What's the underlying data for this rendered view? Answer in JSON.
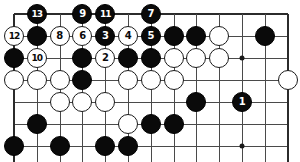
{
  "diagram": {
    "type": "go-board-problem-diagram",
    "board": {
      "columns": 13,
      "rows": 7,
      "origin_x": 14,
      "origin_y": 14,
      "step_x": 22.8,
      "step_y": 22.0,
      "line_color": "#4a4a4a",
      "edge_color": "#2b2b2b",
      "background_color": "#ffffff"
    },
    "star_points": [
      {
        "col": 2,
        "row": 6
      },
      {
        "col": 10,
        "row": 6
      },
      {
        "col": 10,
        "row": 2
      }
    ],
    "stones": [
      {
        "col": 1,
        "row": 0,
        "color": "black",
        "label": "13"
      },
      {
        "col": 3,
        "row": 0,
        "color": "black",
        "label": "9"
      },
      {
        "col": 4,
        "row": 0,
        "color": "black",
        "label": "11"
      },
      {
        "col": 6,
        "row": 0,
        "color": "black",
        "label": "7"
      },
      {
        "col": 0,
        "row": 1,
        "color": "white",
        "label": "12"
      },
      {
        "col": 1,
        "row": 1,
        "color": "black",
        "label": ""
      },
      {
        "col": 2,
        "row": 1,
        "color": "white",
        "label": "8"
      },
      {
        "col": 3,
        "row": 1,
        "color": "white",
        "label": "6"
      },
      {
        "col": 4,
        "row": 1,
        "color": "black",
        "label": "3"
      },
      {
        "col": 5,
        "row": 1,
        "color": "white",
        "label": "4"
      },
      {
        "col": 6,
        "row": 1,
        "color": "black",
        "label": "5"
      },
      {
        "col": 7,
        "row": 1,
        "color": "black",
        "label": ""
      },
      {
        "col": 8,
        "row": 1,
        "color": "black",
        "label": ""
      },
      {
        "col": 9,
        "row": 1,
        "color": "white",
        "label": ""
      },
      {
        "col": 11,
        "row": 1,
        "color": "black",
        "label": ""
      },
      {
        "col": 0,
        "row": 2,
        "color": "black",
        "label": ""
      },
      {
        "col": 1,
        "row": 2,
        "color": "white",
        "label": "10"
      },
      {
        "col": 3,
        "row": 2,
        "color": "black",
        "label": ""
      },
      {
        "col": 4,
        "row": 2,
        "color": "white",
        "label": "2"
      },
      {
        "col": 5,
        "row": 2,
        "color": "black",
        "label": ""
      },
      {
        "col": 6,
        "row": 2,
        "color": "black",
        "label": ""
      },
      {
        "col": 7,
        "row": 2,
        "color": "white",
        "label": ""
      },
      {
        "col": 8,
        "row": 2,
        "color": "white",
        "label": ""
      },
      {
        "col": 9,
        "row": 2,
        "color": "white",
        "label": ""
      },
      {
        "col": 0,
        "row": 3,
        "color": "white",
        "label": ""
      },
      {
        "col": 1,
        "row": 3,
        "color": "white",
        "label": ""
      },
      {
        "col": 2,
        "row": 3,
        "color": "white",
        "label": ""
      },
      {
        "col": 3,
        "row": 3,
        "color": "black",
        "label": ""
      },
      {
        "col": 5,
        "row": 3,
        "color": "white",
        "label": ""
      },
      {
        "col": 6,
        "row": 3,
        "color": "white",
        "label": ""
      },
      {
        "col": 7,
        "row": 3,
        "color": "white",
        "label": ""
      },
      {
        "col": 12,
        "row": 3,
        "color": "white",
        "label": ""
      },
      {
        "col": 2,
        "row": 4,
        "color": "white",
        "label": ""
      },
      {
        "col": 3,
        "row": 4,
        "color": "white",
        "label": ""
      },
      {
        "col": 4,
        "row": 4,
        "color": "white",
        "label": ""
      },
      {
        "col": 8,
        "row": 4,
        "color": "black",
        "label": ""
      },
      {
        "col": 10,
        "row": 4,
        "color": "black",
        "label": "1"
      },
      {
        "col": 1,
        "row": 5,
        "color": "black",
        "label": ""
      },
      {
        "col": 5,
        "row": 5,
        "color": "white",
        "label": ""
      },
      {
        "col": 6,
        "row": 5,
        "color": "black",
        "label": ""
      },
      {
        "col": 7,
        "row": 5,
        "color": "black",
        "label": ""
      },
      {
        "col": 0,
        "row": 6,
        "color": "black",
        "label": ""
      },
      {
        "col": 2,
        "row": 6,
        "color": "black",
        "label": ""
      },
      {
        "col": 4,
        "row": 6,
        "color": "black",
        "label": ""
      },
      {
        "col": 5,
        "row": 6,
        "color": "black",
        "label": ""
      }
    ]
  }
}
